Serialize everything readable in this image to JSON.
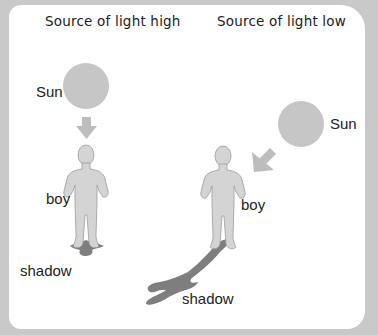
{
  "panels": [
    {
      "title": "Source of light high",
      "labels": {
        "sun": "Sun",
        "boy": "boy",
        "shadow": "shadow"
      }
    },
    {
      "title": "Source of light low",
      "labels": {
        "sun": "Sun",
        "boy": "boy",
        "shadow": "shadow"
      }
    }
  ],
  "colors": {
    "background": "#c9c9c9",
    "card": "#ffffff",
    "sun": "#c6c6c6",
    "arrow": "#bdbdbd",
    "boy_fill": "#d4d4d4",
    "boy_outline": "#9a9a9a",
    "shadow": "#7e7e7e"
  }
}
